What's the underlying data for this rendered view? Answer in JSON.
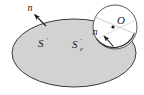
{
  "figure": {
    "background_color": "#ffffff",
    "labels": {
      "surface_outer": "S",
      "surface_outer_prime": "′",
      "surface_inner": "S",
      "surface_inner_prime": "′",
      "surface_inner_subscript": "ε",
      "normal_outer": "n",
      "normal_inner": "n",
      "point": "O"
    },
    "shapes": {
      "ellipse": {
        "name": "surface-region",
        "cx": 74,
        "cy": 53,
        "rx": 62,
        "ry": 34,
        "fill": "#d2d2d2",
        "stroke": "#3a3a3a",
        "stroke_width": 1
      },
      "circle": {
        "name": "epsilon-disk",
        "cx": 115,
        "cy": 27,
        "r": 22,
        "fill": "#ffffff",
        "stroke": "#4a4a4a",
        "stroke_width": 1
      },
      "point_marker": {
        "name": "point-O-marker",
        "cx": 113,
        "cy": 27,
        "r": 1.6,
        "fill": "#1a1a1a"
      }
    },
    "arrows": {
      "outer_normal": {
        "name": "outer-normal-arrow",
        "from_x": 46,
        "from_y": 26,
        "to_x": 33,
        "to_y": 13,
        "stroke": "#1a1a1a"
      },
      "inner_normal": {
        "name": "inner-normal-arrow",
        "from_x": 113,
        "from_y": 46,
        "to_x": 103,
        "to_y": 35,
        "stroke": "#1a1a1a"
      }
    },
    "label_positions": {
      "normal_outer": {
        "x": 30,
        "y": 11
      },
      "normal_inner": {
        "x": 92,
        "y": 32
      },
      "point": {
        "x": 119,
        "y": 24
      },
      "surface_outer": {
        "x": 41,
        "y": 45
      },
      "surface_inner": {
        "x": 75,
        "y": 47
      }
    }
  }
}
